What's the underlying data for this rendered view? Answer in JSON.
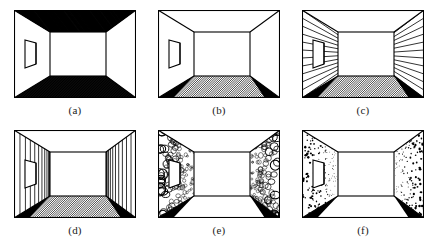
{
  "figure": {
    "background_color": "#ffffff",
    "ink_color": "#000000",
    "rows": 2,
    "columns": 3,
    "panel_count": 6
  },
  "panels": [
    {
      "id": "a",
      "caption": "(a)",
      "texture_name": "dense-hatched-ceiling-and-floor",
      "description": "Room with heavily inked hatched ceiling and hatched floor, plain white side walls and back wall, door opening on left wall",
      "ceiling_texture": "dense-hatch",
      "floor_texture": "dense-hatch",
      "left_wall_texture": "plain",
      "right_wall_texture": "plain",
      "back_wall_texture": "plain",
      "has_door": true
    },
    {
      "id": "b",
      "caption": "(b)",
      "texture_name": "hatched-floor-only",
      "description": "Room with diagonally hatched floor, solid black corner wedges at floor edges, plain ceiling and walls, door opening on left wall",
      "ceiling_texture": "plain",
      "floor_texture": "diagonal-hatch",
      "left_wall_texture": "plain",
      "right_wall_texture": "plain",
      "back_wall_texture": "plain",
      "has_door": true
    },
    {
      "id": "c",
      "caption": "(c)",
      "texture_name": "radiating-horizontal-wall-lines",
      "description": "Room with converging horizontal lines on both side walls radiating toward the vanishing point, hatched floor, door opening on left wall",
      "ceiling_texture": "plain",
      "floor_texture": "diagonal-hatch",
      "left_wall_texture": "radiating-lines",
      "right_wall_texture": "radiating-lines",
      "back_wall_texture": "plain",
      "has_door": true
    },
    {
      "id": "d",
      "caption": "(d)",
      "texture_name": "vertical-wall-lines",
      "description": "Room with vertical stripes on both side walls compressing toward the vanishing point, hatched floor, door opening on left wall",
      "ceiling_texture": "plain",
      "floor_texture": "diagonal-hatch",
      "left_wall_texture": "vertical-lines",
      "right_wall_texture": "vertical-lines",
      "back_wall_texture": "plain",
      "has_door": true
    },
    {
      "id": "e",
      "caption": "(e)",
      "texture_name": "pebble-gradient-walls",
      "description": "Room with large-to-small circular pebble texture on both side walls showing a texture density gradient, black floor corner wedges, plain floor, door opening on left wall",
      "ceiling_texture": "plain",
      "floor_texture": "plain",
      "left_wall_texture": "pebbles",
      "right_wall_texture": "pebbles",
      "back_wall_texture": "plain",
      "has_door": true
    },
    {
      "id": "f",
      "caption": "(f)",
      "texture_name": "speckle-gradient-walls",
      "description": "Room with fine random speckle texture on both side walls, black floor corner wedges, plain floor, door opening on left wall",
      "ceiling_texture": "plain",
      "floor_texture": "plain",
      "left_wall_texture": "speckles",
      "right_wall_texture": "speckles",
      "back_wall_texture": "plain",
      "has_door": true
    }
  ]
}
